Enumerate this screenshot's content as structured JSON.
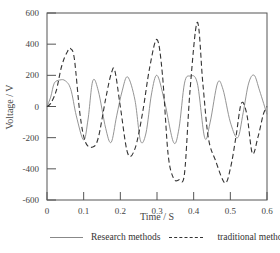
{
  "chart_data": {
    "type": "line",
    "title": "",
    "xlabel": "Time / S",
    "ylabel": "Voltage / V",
    "xlim": [
      0,
      0.6
    ],
    "ylim": [
      -600,
      600
    ],
    "xticks": [
      "0",
      "0.1",
      "0.2",
      "0.3",
      "0.4",
      "0.5",
      "0.6"
    ],
    "yticks": [
      "600",
      "400",
      "200",
      "0",
      "-200",
      "-400",
      "-600"
    ],
    "grid": false,
    "legend_position": "bottom",
    "series": [
      {
        "name": "Research methods",
        "style": "solid",
        "color": "#888888",
        "x": [
          0,
          0.01,
          0.02,
          0.035,
          0.05,
          0.065,
          0.08,
          0.1,
          0.112,
          0.125,
          0.14,
          0.16,
          0.175,
          0.19,
          0.205,
          0.22,
          0.24,
          0.255,
          0.27,
          0.285,
          0.3,
          0.32,
          0.345,
          0.36,
          0.375,
          0.39,
          0.41,
          0.43,
          0.445,
          0.465,
          0.48,
          0.5,
          0.52,
          0.535,
          0.55,
          0.565,
          0.58,
          0.6
        ],
        "y": [
          0,
          60,
          150,
          170,
          165,
          110,
          -60,
          -215,
          -80,
          165,
          100,
          -140,
          -230,
          -60,
          100,
          190,
          40,
          -220,
          -170,
          80,
          200,
          40,
          -230,
          -140,
          150,
          195,
          150,
          -200,
          -100,
          150,
          110,
          -100,
          -200,
          -40,
          150,
          200,
          100,
          -50
        ]
      },
      {
        "name": "traditional method",
        "style": "dashed",
        "color": "#333333",
        "x": [
          0,
          0.01,
          0.025,
          0.04,
          0.055,
          0.065,
          0.075,
          0.09,
          0.105,
          0.125,
          0.14,
          0.16,
          0.175,
          0.185,
          0.2,
          0.22,
          0.24,
          0.26,
          0.28,
          0.3,
          0.315,
          0.33,
          0.345,
          0.36,
          0.375,
          0.39,
          0.41,
          0.425,
          0.44,
          0.46,
          0.485,
          0.5,
          0.515,
          0.53,
          0.545,
          0.56,
          0.575,
          0.59,
          0.6
        ],
        "y": [
          0,
          20,
          100,
          260,
          350,
          370,
          300,
          -50,
          -230,
          -260,
          -200,
          50,
          210,
          230,
          0,
          -300,
          -270,
          -50,
          250,
          430,
          200,
          -300,
          -460,
          -470,
          -430,
          100,
          540,
          150,
          -200,
          -350,
          -490,
          -400,
          -200,
          20,
          -50,
          -300,
          -200,
          -50,
          0
        ]
      }
    ]
  },
  "axes": {
    "xlabel": "Time / S",
    "ylabel": "Voltage / V",
    "xticks": [
      "0",
      "0.1",
      "0.2",
      "0.3",
      "0.4",
      "0.5",
      "0.6"
    ],
    "yticks": [
      "600",
      "400",
      "200",
      "0",
      "-200",
      "-400",
      "-600"
    ]
  },
  "legend": {
    "items": [
      {
        "label": "Research methods",
        "style": "solid"
      },
      {
        "label": "traditional method",
        "style": "dashed"
      }
    ]
  },
  "colors": {
    "axis": "#555555",
    "solid_series": "#888888",
    "dashed_series": "#333333"
  }
}
